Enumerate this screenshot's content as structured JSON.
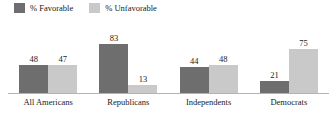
{
  "legend": {
    "position": "top-left",
    "items": [
      {
        "label": "% Favorable",
        "color": "#6e6e6e",
        "swatch_name": "favorable-swatch"
      },
      {
        "label": "% Unfavorable",
        "color": "#c9c9c9",
        "swatch_name": "unfavorable-swatch"
      }
    ]
  },
  "chart_data": {
    "type": "bar",
    "title": "",
    "xlabel": "",
    "ylabel": "",
    "ylim": [
      0,
      100
    ],
    "grid": false,
    "legend_position": "top-left",
    "categories": [
      "All Americans",
      "Republicans",
      "Independents",
      "Democrats"
    ],
    "series": [
      {
        "name": "% Favorable",
        "color": "#6e6e6e",
        "values": [
          48,
          83,
          44,
          21
        ]
      },
      {
        "name": "% Unfavorable",
        "color": "#c9c9c9",
        "values": [
          47,
          13,
          48,
          75
        ]
      }
    ]
  },
  "axis": {
    "baseline_color": "#b3b3b3"
  }
}
